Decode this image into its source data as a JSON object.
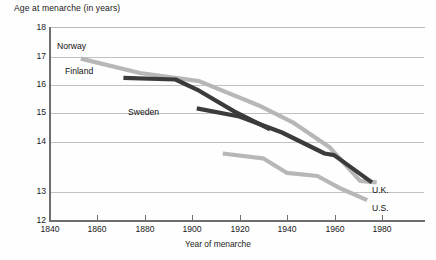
{
  "chart_data": {
    "type": "line",
    "title": "Age at menarche (in years)",
    "xlabel": "Year of menarche",
    "ylabel": "Age at menarche (in years)",
    "xlim": [
      1832,
      1990
    ],
    "ylim": [
      12,
      18
    ],
    "grid": true,
    "legend_position": "inline-annotations",
    "xticks": [
      1840,
      1860,
      1880,
      1900,
      1920,
      1940,
      1960,
      1980
    ],
    "yticks": [
      12,
      13,
      14,
      15,
      16,
      17,
      18
    ],
    "series": [
      {
        "name": "Norway",
        "color": "#b7b7b7",
        "label_position": "upper-left",
        "x": [
          1845,
          1870,
          1895,
          1920,
          1935,
          1950,
          1963,
          1970
        ],
        "values": [
          17.05,
          16.6,
          16.35,
          15.6,
          15.05,
          14.3,
          13.25,
          13.2
        ]
      },
      {
        "name": "Finland",
        "color": "#3b3b3b",
        "label_position": "upper-left",
        "x": [
          1863,
          1885,
          1895,
          1910,
          1925
        ],
        "values": [
          16.45,
          16.4,
          16.05,
          15.4,
          14.85
        ]
      },
      {
        "name": "Sweden",
        "color": "#3b3b3b",
        "label_position": "middle-left",
        "x": [
          1894,
          1912,
          1930,
          1948,
          1952,
          1968
        ],
        "values": [
          15.5,
          15.25,
          14.75,
          14.1,
          14.05,
          13.2
        ]
      },
      {
        "name": "U.K.",
        "color": "#3b3b3b",
        "label_position": "lower-right",
        "x": [
          1948,
          1968
        ],
        "values": [
          14.05,
          13.2
        ]
      },
      {
        "name": "U.S.",
        "color": "#b7b7b7",
        "label_position": "lower-right",
        "x": [
          1905,
          1922,
          1932,
          1945,
          1955,
          1966
        ],
        "values": [
          14.1,
          13.95,
          13.5,
          13.4,
          13.0,
          12.65
        ]
      }
    ],
    "annotations": [
      {
        "text": "Norway",
        "x": 1851,
        "y": 17.45
      },
      {
        "text": "Finland",
        "x": 1859,
        "y": 16.62
      },
      {
        "text": "Sweden",
        "x": 1890,
        "y": 15.25
      },
      {
        "text": "U.K.",
        "x": 1972,
        "y": 13.12
      },
      {
        "text": "U.S.",
        "x": 1972,
        "y": 12.7
      }
    ]
  },
  "ytick_labels": [
    "18",
    "17",
    "16",
    "15",
    "14",
    "13",
    "12"
  ],
  "xtick_labels": [
    "1840",
    "1860",
    "1880",
    "1900",
    "1920",
    "1940",
    "1960",
    "1980"
  ],
  "labels": {
    "norway": "Norway",
    "finland": "Finland",
    "sweden": "Sweden",
    "uk": "U.K.",
    "us": "U.S."
  }
}
